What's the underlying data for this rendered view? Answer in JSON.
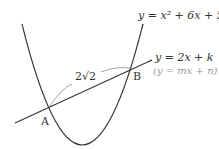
{
  "diagram": {
    "parabola_label": "y = x² + 6x + 5",
    "line_label": "y = 2x + k",
    "line_label_general": "(y = mx + n)",
    "length_label": "2√2",
    "point_a": "A",
    "point_b": "B",
    "colors": {
      "curve": "#333333",
      "arc": "#9a9a9a",
      "general_label": "#9a9a9a"
    }
  }
}
